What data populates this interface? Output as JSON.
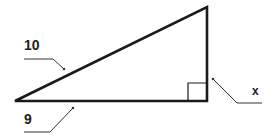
{
  "diagram": {
    "type": "right-triangle",
    "labels": {
      "hypotenuse": "10",
      "base": "9",
      "height": "x"
    },
    "colors": {
      "stroke": "#1a1a1a",
      "leader": "#333333",
      "background": "#ffffff"
    }
  }
}
